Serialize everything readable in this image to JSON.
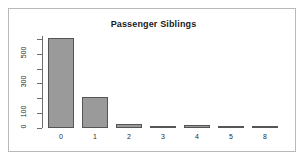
{
  "chart_data": {
    "type": "bar",
    "title": "Passenger Siblings",
    "xlabel": "",
    "ylabel": "",
    "categories": [
      "0",
      "1",
      "2",
      "3",
      "4",
      "5",
      "8"
    ],
    "values": [
      608,
      209,
      28,
      16,
      18,
      5,
      7
    ],
    "ylim": [
      0,
      620
    ],
    "ytick_values": [
      0,
      100,
      200,
      300,
      400,
      500,
      600
    ],
    "ytick_labels": [
      "0",
      "100",
      "",
      "300",
      "",
      "500",
      ""
    ],
    "grid": false,
    "legend": null,
    "bar_fill": "#9a9a9a",
    "bar_border": "#555555",
    "axis_color": "#6e6e6e",
    "text_color": "#2b2b2b",
    "background": "#ffffff",
    "frame_color": "#b9b9b9"
  }
}
